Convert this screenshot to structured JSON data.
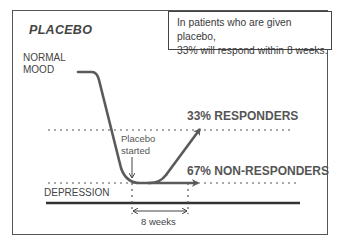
{
  "diagram": {
    "title": "PLACEBO",
    "info_box": {
      "line1": "In patients who are given placebo,",
      "line2": "33% will respond within 8 weeks."
    },
    "levels": {
      "normal_mood_line1": "NORMAL",
      "normal_mood_line2": "MOOD",
      "depression": "DEPRESSION"
    },
    "annotation": {
      "line1": "Placebo",
      "line2": "started"
    },
    "outcomes": {
      "responders": "33% RESPONDERS",
      "non_responders": "67% NON-RESPONDERS"
    },
    "duration_label": "8 weeks",
    "colors": {
      "curve": "#5a5a5a",
      "text": "#444444",
      "frame": "#555555"
    }
  }
}
